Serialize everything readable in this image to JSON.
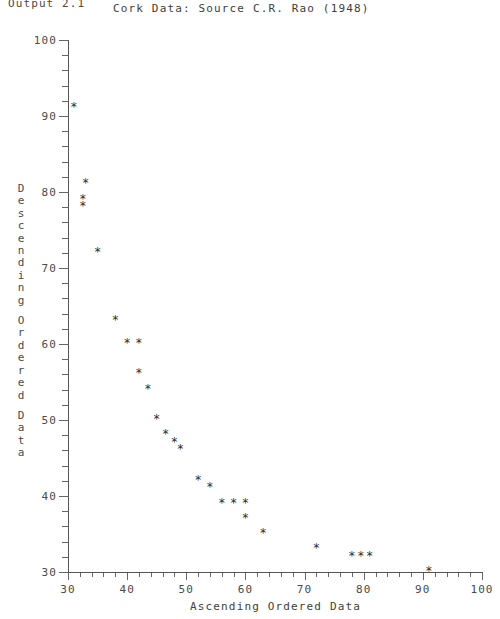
{
  "output_label": "Output 2.1",
  "axis": {
    "y_title_chars": [
      "D",
      "e",
      "s",
      "c",
      "e",
      "n",
      "d",
      "i",
      "n",
      "g",
      "",
      "O",
      "r",
      "d",
      "e",
      "r",
      "e",
      "d",
      "",
      "D",
      "a",
      "t",
      "a"
    ],
    "marker_glyph": "*"
  },
  "chart_data": {
    "type": "scatter",
    "title": "Cork Data: Source C.R. Rao (1948)",
    "xlabel": "Ascending Ordered Data",
    "ylabel": "Descending Ordered Data",
    "xlim": [
      30,
      100
    ],
    "ylim": [
      30,
      100
    ],
    "xticks": [
      30,
      40,
      50,
      60,
      70,
      80,
      90,
      100
    ],
    "yticks": [
      30,
      40,
      50,
      60,
      70,
      80,
      90,
      100
    ],
    "xtick_labels": [
      "30",
      "40",
      "50",
      "60",
      "70",
      "80",
      "90",
      "100"
    ],
    "ytick_labels": [
      "30",
      "40",
      "50",
      "60",
      "70",
      "80",
      "90",
      "100"
    ],
    "minor_tick_step": 2,
    "grid": false,
    "legend": null,
    "points": [
      {
        "x": 31,
        "y": 91
      },
      {
        "x": 33,
        "y": 81
      },
      {
        "x": 32.5,
        "y": 79
      },
      {
        "x": 32.5,
        "y": 78
      },
      {
        "x": 35,
        "y": 72
      },
      {
        "x": 38,
        "y": 63
      },
      {
        "x": 40,
        "y": 60
      },
      {
        "x": 42,
        "y": 60
      },
      {
        "x": 42,
        "y": 56
      },
      {
        "x": 43.5,
        "y": 54
      },
      {
        "x": 45,
        "y": 50
      },
      {
        "x": 46.5,
        "y": 48
      },
      {
        "x": 48,
        "y": 47
      },
      {
        "x": 49,
        "y": 46
      },
      {
        "x": 52,
        "y": 42
      },
      {
        "x": 54,
        "y": 41
      },
      {
        "x": 56,
        "y": 39
      },
      {
        "x": 58,
        "y": 39
      },
      {
        "x": 60,
        "y": 39
      },
      {
        "x": 60,
        "y": 37
      },
      {
        "x": 63,
        "y": 35
      },
      {
        "x": 72,
        "y": 33
      },
      {
        "x": 78,
        "y": 32
      },
      {
        "x": 79.5,
        "y": 32
      },
      {
        "x": 81,
        "y": 32
      },
      {
        "x": 91,
        "y": 30
      }
    ]
  }
}
